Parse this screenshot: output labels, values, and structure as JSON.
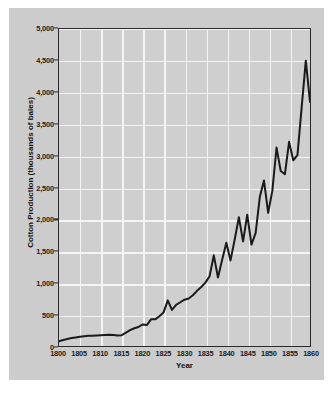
{
  "chart_data": {
    "type": "line",
    "title": "",
    "xlabel": "Year",
    "ylabel": "Cotton Production (thousands of bales)",
    "xlim": [
      1800,
      1860
    ],
    "ylim": [
      0,
      5000
    ],
    "xticks": [
      1800,
      1805,
      1810,
      1815,
      1820,
      1825,
      1830,
      1835,
      1840,
      1845,
      1850,
      1855,
      1860
    ],
    "xtick_labels": [
      "1800",
      "1805",
      "1810",
      "1815",
      "1820",
      "1825",
      "1830",
      "1835",
      "1840",
      "1845",
      "1850",
      "1855",
      "1860"
    ],
    "yticks": [
      0,
      500,
      1000,
      1500,
      2000,
      2500,
      3000,
      3500,
      4000,
      4500,
      5000
    ],
    "ytick_labels": [
      "0",
      "500",
      "1,000",
      "1,500",
      "2,000",
      "2,500",
      "3,000",
      "3,500",
      "4,000",
      "4,500",
      "5,000"
    ],
    "grid": true,
    "grid_color": "#f4f4f4",
    "plot_background": "#cfcfcf",
    "figure_background": "#cccccc",
    "line_color": "#1a1a1a",
    "line_width": 2.0,
    "legend": null,
    "series": [
      {
        "name": "Cotton Production",
        "x": [
          1800,
          1801,
          1802,
          1803,
          1804,
          1805,
          1806,
          1807,
          1808,
          1809,
          1810,
          1811,
          1812,
          1813,
          1814,
          1815,
          1816,
          1817,
          1818,
          1819,
          1820,
          1821,
          1822,
          1823,
          1824,
          1825,
          1826,
          1827,
          1828,
          1829,
          1830,
          1831,
          1832,
          1833,
          1834,
          1835,
          1836,
          1837,
          1838,
          1839,
          1840,
          1841,
          1842,
          1843,
          1844,
          1845,
          1846,
          1847,
          1848,
          1849,
          1850,
          1851,
          1852,
          1853,
          1854,
          1855,
          1856,
          1857,
          1858,
          1859,
          1860
        ],
        "y": [
          75,
          95,
          110,
          125,
          135,
          145,
          155,
          160,
          160,
          165,
          170,
          175,
          178,
          175,
          165,
          170,
          210,
          250,
          280,
          300,
          340,
          330,
          420,
          420,
          470,
          530,
          720,
          570,
          650,
          690,
          730,
          750,
          800,
          870,
          930,
          1000,
          1100,
          1430,
          1080,
          1360,
          1630,
          1350,
          1680,
          2030,
          1650,
          2070,
          1600,
          1780,
          2350,
          2610,
          2100,
          2450,
          3130,
          2760,
          2710,
          3220,
          2930,
          3010,
          3760,
          4500,
          3850
        ]
      }
    ],
    "annotations": []
  },
  "axes": {
    "y_axis_title": "Cotton Production (thousands of bales)",
    "x_axis_title": "Year"
  }
}
